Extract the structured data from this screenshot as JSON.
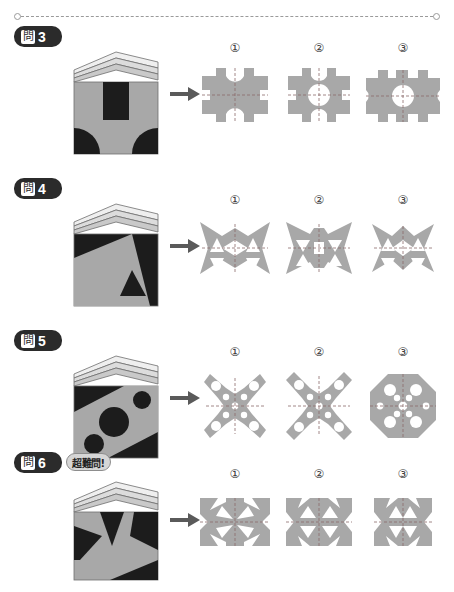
{
  "page": {
    "cut_line": {
      "name": "cut-line",
      "style": "dashed",
      "end_marker": "circle"
    },
    "colors": {
      "paper_gray": "#a8a8a8",
      "ink_black": "#1c1c1c",
      "badge_dark": "#2b2b2b",
      "hard_badge_fill": "#d6d6d6",
      "arrow": "#5a5a5a",
      "fold_line": "#8a6a6a",
      "background": "#ffffff"
    }
  },
  "problems": [
    {
      "id": "p3",
      "badge": {
        "kanji": "問",
        "number": "3"
      },
      "hard_label": null,
      "arrow": "→",
      "booklet": {
        "name": "folded-booklet-problem-3",
        "description": "gray folded booklet cover with black rectangle at top center and black quarter circles at bottom corners"
      },
      "options": [
        {
          "label": "①",
          "name": "option-1",
          "description": "gray square with semicircular notches on all four edges and rectangular notches at corners"
        },
        {
          "label": "②",
          "name": "option-2",
          "description": "gray square with center circular hole and semicircular edge notches"
        },
        {
          "label": "③",
          "name": "option-3",
          "description": "wide gray shape with center circular hole, side semicircles and rectangular notches"
        }
      ]
    },
    {
      "id": "p4",
      "badge": {
        "kanji": "問",
        "number": "4"
      },
      "hard_label": null,
      "arrow": "→",
      "booklet": {
        "name": "folded-booklet-problem-4",
        "description": "black cover with large gray triangle and small black triangle inside"
      },
      "options": [
        {
          "label": "①",
          "name": "option-1",
          "description": "gray bowtie shape with four triangular holes and central diamond hole"
        },
        {
          "label": "②",
          "name": "option-2",
          "description": "gray butterfly shape with inverted triangular holes and central slot"
        },
        {
          "label": "③",
          "name": "option-3",
          "description": "gray four pointed star shape with triangular holes and central diamond"
        }
      ]
    },
    {
      "id": "p5",
      "badge": {
        "kanji": "問",
        "number": "5"
      },
      "hard_label": null,
      "arrow": "→",
      "booklet": {
        "name": "folded-booklet-problem-5",
        "description": "black cover with diagonal gray band containing three black circles"
      },
      "options": [
        {
          "label": "①",
          "name": "option-1",
          "description": "gray X shape with round holes on each arm"
        },
        {
          "label": "②",
          "name": "option-2",
          "description": "gray X shape with round holes, slightly different arm widths"
        },
        {
          "label": "③",
          "name": "option-3",
          "description": "gray octagon with ring of round holes around a center hole"
        }
      ]
    },
    {
      "id": "p6",
      "badge": {
        "kanji": "問",
        "number": "6"
      },
      "hard_label": "超難問!",
      "arrow": "→",
      "booklet": {
        "name": "folded-booklet-problem-6",
        "description": "gray cover with black zigzag lightning shapes"
      },
      "options": [
        {
          "label": "①",
          "name": "option-1",
          "description": "gray block with radiating white wedge slots from center"
        },
        {
          "label": "②",
          "name": "option-2",
          "description": "gray block with white triangular wedges pointing inward"
        },
        {
          "label": "③",
          "name": "option-3",
          "description": "narrow gray block with white wedges and notched edges"
        }
      ]
    }
  ]
}
